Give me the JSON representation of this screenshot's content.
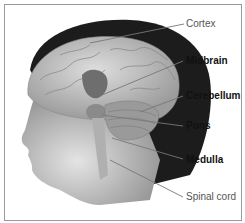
{
  "diagram": {
    "type": "anatomical-illustration",
    "labels": [
      {
        "id": "cortex",
        "text": "Cortex",
        "weight": "light"
      },
      {
        "id": "midbrain",
        "text": "Midbrain",
        "weight": "bold"
      },
      {
        "id": "cerebellum",
        "text": "Cerebellum",
        "weight": "bold"
      },
      {
        "id": "pons",
        "text": "Pons",
        "weight": "bold"
      },
      {
        "id": "medulla",
        "text": "Medulla",
        "weight": "bold"
      },
      {
        "id": "spinal_cord",
        "text": "Spinal cord",
        "weight": "light"
      }
    ]
  },
  "colors": {
    "hair": "#1a1a1a",
    "skin": "#c8c8c8",
    "brain": "#bdbdbd",
    "midbrain_highlight": "#6e6e6e",
    "leader_line": "#777777",
    "border": "#9a9a9a"
  }
}
